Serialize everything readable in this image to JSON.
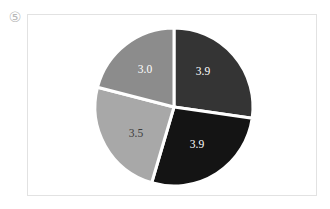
{
  "figure": {
    "marker": "⑤",
    "marker_icon_name": "circled-number-5-icon"
  },
  "panel": {
    "border_color": "#e2e2e2",
    "background": "#ffffff"
  },
  "chart_data": {
    "type": "pie",
    "title": "",
    "subtitle": "",
    "xlabel": "",
    "ylabel": "",
    "grid": false,
    "legend": "none",
    "total": 14.3,
    "start_angle_deg": 0,
    "direction": "clockwise",
    "separator_color": "#ffffff",
    "separator_width_px": 3,
    "labels": [
      "3.9",
      "3.9",
      "3.5",
      "3.0"
    ],
    "values": [
      3.9,
      3.9,
      3.5,
      3.0
    ],
    "colors": [
      "#343434",
      "#141414",
      "#a8a8a8",
      "#8c8c8c"
    ],
    "label_colors": [
      "#ffffff",
      "#ffffff",
      "#3d3d3d",
      "#ffffff"
    ],
    "slices": [
      {
        "name": "slice-top-right",
        "label": "3.9",
        "value": 3.9,
        "color": "#343434",
        "label_color": "#ffffff",
        "start_deg": 0,
        "end_deg": 98.2,
        "label_x": 203,
        "label_y": 72
      },
      {
        "name": "slice-bottom-right",
        "label": "3.9",
        "value": 3.9,
        "color": "#141414",
        "label_color": "#ffffff",
        "start_deg": 98.2,
        "end_deg": 196.4,
        "label_x": 197,
        "label_y": 145
      },
      {
        "name": "slice-bottom-left",
        "label": "3.5",
        "value": 3.5,
        "color": "#a8a8a8",
        "label_color": "#3d3d3d",
        "start_deg": 196.4,
        "end_deg": 284.5,
        "label_x": 136,
        "label_y": 134
      },
      {
        "name": "slice-top-left",
        "label": "3.0",
        "value": 3.0,
        "color": "#8c8c8c",
        "label_color": "#ffffff",
        "start_deg": 284.5,
        "end_deg": 360,
        "label_x": 145,
        "label_y": 70
      }
    ],
    "geometry": {
      "center_x": 174,
      "center_y": 107,
      "radius": 79
    }
  }
}
